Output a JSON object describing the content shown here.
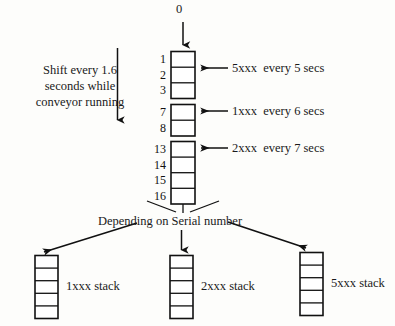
{
  "diagram": {
    "top_label": "0",
    "shift_note": [
      "Shift every 1.6",
      "seconds while",
      "conveyor running"
    ],
    "branch_note": "Depending on Serial number",
    "main_column": {
      "groups": [
        {
          "name": "group-1",
          "cell_numbers": [
            "1",
            "2",
            "3"
          ]
        },
        {
          "name": "group-2",
          "cell_numbers": [
            "7",
            "8"
          ]
        },
        {
          "name": "group-3",
          "cell_numbers": [
            "13",
            "14",
            "15",
            "16"
          ]
        }
      ]
    },
    "feed_arrows": [
      {
        "name": "feed-5xxx",
        "label": "5xxx  every 5 secs"
      },
      {
        "name": "feed-1xxx",
        "label": "1xxx  every 6 secs"
      },
      {
        "name": "feed-2xxx",
        "label": "2xxx  every 7 secs"
      }
    ],
    "stacks": [
      {
        "name": "stack-1xxx",
        "label": "1xxx stack",
        "cells": 5
      },
      {
        "name": "stack-2xxx",
        "label": "2xxx stack",
        "cells": 5
      },
      {
        "name": "stack-5xxx",
        "label": "5xxx stack",
        "cells": 5
      }
    ],
    "colors": {
      "stroke": "#111111",
      "background": "#fdfdfb",
      "text": "#111111"
    }
  }
}
